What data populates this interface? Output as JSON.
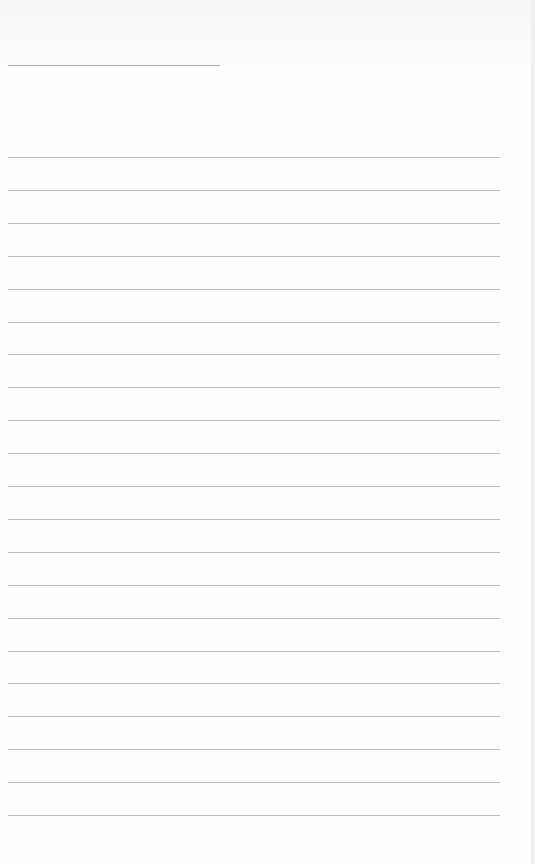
{
  "page": {
    "type": "lined-notebook-page",
    "title_line": {
      "x": 8,
      "y": 65,
      "width": 212
    },
    "rules": {
      "count": 21,
      "start_y": 157,
      "spacing": 32.9,
      "x": 8,
      "width": 492
    },
    "colors": {
      "background": "#fcfcfc",
      "rule": "#bdbdbd",
      "title_line": "#a9a9a9"
    }
  }
}
